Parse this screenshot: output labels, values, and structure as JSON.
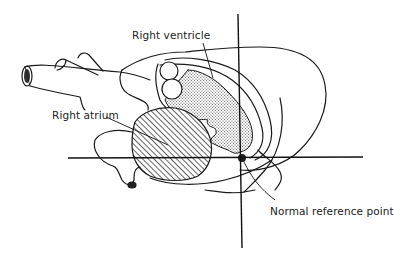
{
  "figure": {
    "type": "anatomical-diagram",
    "labels": {
      "right_ventricle": "Right ventricle",
      "right_atrium": "Right atrium",
      "reference_point": "Normal reference point"
    },
    "colors": {
      "ink": "#1a1a1a",
      "background": "#ffffff"
    },
    "patterns": {
      "right_ventricle": "stippled",
      "right_atrium": "hatched"
    }
  }
}
